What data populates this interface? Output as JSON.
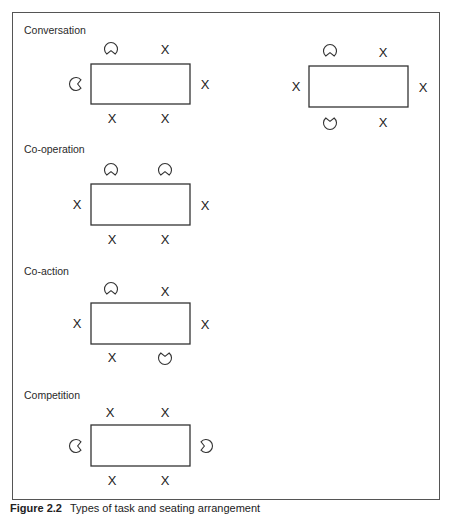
{
  "figure": {
    "caption_label": "Figure 2.2",
    "caption_text": "Types of task and seating arrangement"
  },
  "icons": {
    "person": "pacman-person-icon",
    "empty_seat": "x-mark"
  },
  "seat_mark": "X",
  "sections": [
    {
      "title": "Conversation",
      "title_pos": [
        24,
        34
      ],
      "arrangements": [
        {
          "table": {
            "x": 91,
            "y": 64,
            "w": 99,
            "h": 40
          },
          "persons": [
            {
              "x": 111,
              "y": 49,
              "facing": "down"
            },
            {
              "x": 76,
              "y": 84,
              "facing": "right"
            }
          ],
          "empty": [
            {
              "x": 165,
              "y": 49
            },
            {
              "x": 205,
              "y": 84
            },
            {
              "x": 112,
              "y": 118
            },
            {
              "x": 165,
              "y": 118
            }
          ]
        },
        {
          "table": {
            "x": 309,
            "y": 66,
            "w": 99,
            "h": 41
          },
          "persons": [
            {
              "x": 330,
              "y": 51,
              "facing": "down"
            },
            {
              "x": 330,
              "y": 123,
              "facing": "up"
            }
          ],
          "empty": [
            {
              "x": 383,
              "y": 52
            },
            {
              "x": 296,
              "y": 86
            },
            {
              "x": 423,
              "y": 87
            },
            {
              "x": 383,
              "y": 122
            }
          ]
        }
      ]
    },
    {
      "title": "Co-operation",
      "title_pos": [
        24,
        153
      ],
      "arrangements": [
        {
          "table": {
            "x": 91,
            "y": 184,
            "w": 99,
            "h": 41
          },
          "persons": [
            {
              "x": 111,
              "y": 170,
              "facing": "down"
            },
            {
              "x": 165,
              "y": 170,
              "facing": "down"
            }
          ],
          "empty": [
            {
              "x": 77,
              "y": 204
            },
            {
              "x": 205,
              "y": 205
            },
            {
              "x": 112,
              "y": 239
            },
            {
              "x": 165,
              "y": 239
            }
          ]
        }
      ]
    },
    {
      "title": "Co-action",
      "title_pos": [
        24,
        275
      ],
      "arrangements": [
        {
          "table": {
            "x": 91,
            "y": 303,
            "w": 99,
            "h": 41
          },
          "persons": [
            {
              "x": 111,
              "y": 289,
              "facing": "down"
            },
            {
              "x": 165,
              "y": 358,
              "facing": "up"
            }
          ],
          "empty": [
            {
              "x": 165,
              "y": 291
            },
            {
              "x": 77,
              "y": 323
            },
            {
              "x": 205,
              "y": 324
            },
            {
              "x": 112,
              "y": 357
            }
          ]
        }
      ]
    },
    {
      "title": "Competition",
      "title_pos": [
        24,
        399
      ],
      "arrangements": [
        {
          "table": {
            "x": 91,
            "y": 425,
            "w": 99,
            "h": 41
          },
          "persons": [
            {
              "x": 76,
              "y": 446,
              "facing": "right"
            },
            {
              "x": 206,
              "y": 446,
              "facing": "left"
            }
          ],
          "empty": [
            {
              "x": 110,
              "y": 412
            },
            {
              "x": 165,
              "y": 412
            },
            {
              "x": 112,
              "y": 480
            },
            {
              "x": 165,
              "y": 480
            }
          ]
        }
      ]
    }
  ]
}
